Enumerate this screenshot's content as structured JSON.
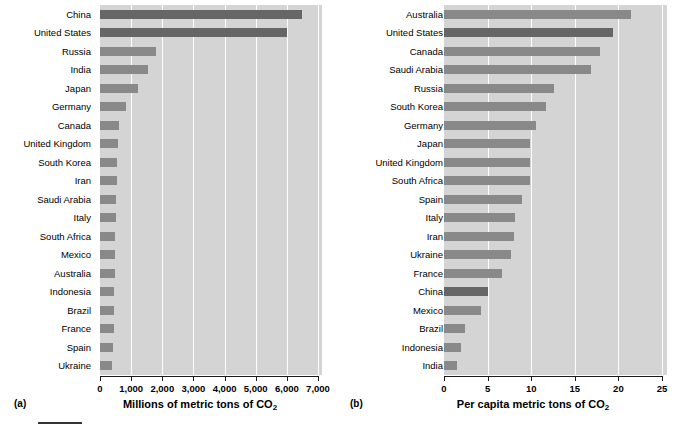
{
  "figure": {
    "panels": [
      {
        "caption": "(a)",
        "axis_title": "Millions of metric tons of CO",
        "axis_title_sub": "2"
      },
      {
        "caption": "(b)",
        "axis_title": "Per capita metric tons of CO",
        "axis_title_sub": "2"
      }
    ]
  },
  "chart_data": [
    {
      "type": "bar",
      "orientation": "horizontal",
      "panel": "(a)",
      "title": "",
      "xlabel": "Millions of metric tons of CO2",
      "ylabel": "",
      "xlim": [
        0,
        7000
      ],
      "xticks": [
        0,
        1000,
        2000,
        3000,
        4000,
        5000,
        6000,
        7000
      ],
      "xticklabels": [
        "0",
        "1,000",
        "2,000",
        "3,000",
        "4,000",
        "5,000",
        "6,000",
        "7,000"
      ],
      "grid": true,
      "legend": "none",
      "categories": [
        "China",
        "United States",
        "Russia",
        "India",
        "Japan",
        "Germany",
        "Canada",
        "United Kingdom",
        "South Korea",
        "Iran",
        "Saudi Arabia",
        "Italy",
        "South Africa",
        "Mexico",
        "Australia",
        "Indonesia",
        "Brazil",
        "France",
        "Spain",
        "Ukraine"
      ],
      "values": [
        6480,
        6000,
        1800,
        1550,
        1230,
        840,
        600,
        570,
        550,
        540,
        520,
        500,
        490,
        480,
        470,
        460,
        450,
        440,
        410,
        400
      ],
      "highlighted": [
        "China",
        "United States"
      ]
    },
    {
      "type": "bar",
      "orientation": "horizontal",
      "panel": "(b)",
      "title": "",
      "xlabel": "Per capita metric tons of CO2",
      "ylabel": "",
      "xlim": [
        0,
        25
      ],
      "xticks": [
        0,
        5,
        10,
        15,
        20,
        25
      ],
      "xticklabels": [
        "0",
        "5",
        "10",
        "15",
        "20",
        "25"
      ],
      "grid": true,
      "legend": "none",
      "categories": [
        "Australia",
        "United States",
        "Canada",
        "Saudi Arabia",
        "Russia",
        "South Korea",
        "Germany",
        "Japan",
        "United Kingdom",
        "South Africa",
        "Spain",
        "Italy",
        "Iran",
        "Ukraine",
        "France",
        "China",
        "Mexico",
        "Brazil",
        "Indonesia",
        "India"
      ],
      "values": [
        21.5,
        19.4,
        17.9,
        16.9,
        12.6,
        11.7,
        10.6,
        9.9,
        9.9,
        9.9,
        9.0,
        8.1,
        8.0,
        7.7,
        6.7,
        5.1,
        4.2,
        2.4,
        1.9,
        1.5
      ],
      "highlighted": [
        "United States",
        "China"
      ]
    }
  ],
  "colors": {
    "bar": "#898989",
    "bar_highlight": "#666666",
    "plot_background": "#d4d4d4",
    "gridline": "#ffffff",
    "axis": "#1a1a1a",
    "text": "#000000"
  }
}
